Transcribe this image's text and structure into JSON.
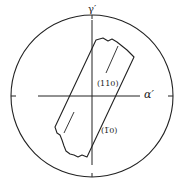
{
  "figure": {
    "type": "stereographic pole figure",
    "axes": {
      "vertical_label": "γ′",
      "horizontal_label": "α′"
    },
    "planes": [
      {
        "label": "(110)"
      },
      {
        "label": "(1̅0)"
      }
    ],
    "labels": {
      "plane_110": "(110)",
      "plane_1bar10": "(1̅0)"
    },
    "colors": {
      "line": "#222222",
      "background": "#ffffff"
    }
  }
}
